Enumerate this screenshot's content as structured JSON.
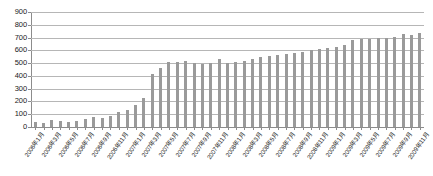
{
  "chart_data": {
    "type": "bar",
    "title": "",
    "subtitle": "",
    "xlabel": "",
    "ylabel": "",
    "ylim": [
      0,
      900
    ],
    "ytick_step": 100,
    "yticks": [
      900,
      800,
      700,
      600,
      500,
      400,
      300,
      200,
      100,
      0
    ],
    "grid": true,
    "legend": false,
    "legend_position": "none",
    "bar_color": "#9a9a9a",
    "gridline_color": "#b6b6b6",
    "axis_color": "#8c8c8c",
    "categories": [
      "2006年1月",
      "2006年2月",
      "2006年3月",
      "2006年4月",
      "2006年5月",
      "2006年6月",
      "2006年7月",
      "2006年8月",
      "2006年9月",
      "2006年10月",
      "2006年11月",
      "2006年12月",
      "2007年1月",
      "2007年2月",
      "2007年3月",
      "2007年4月",
      "2007年5月",
      "2007年6月",
      "2007年7月",
      "2007年8月",
      "2007年9月",
      "2007年10月",
      "2007年11月",
      "2007年12月",
      "2008年1月",
      "2008年2月",
      "2008年3月",
      "2008年4月",
      "2008年5月",
      "2008年6月",
      "2008年7月",
      "2008年8月",
      "2008年9月",
      "2008年10月",
      "2008年11月",
      "2008年12月",
      "2009年1月",
      "2009年2月",
      "2009年3月",
      "2009年4月",
      "2009年5月",
      "2009年6月",
      "2009年7月",
      "2009年8月",
      "2009年9月",
      "2009年10月",
      "2009年11月"
    ],
    "tick_label_every": 2,
    "values": [
      40,
      35,
      55,
      45,
      40,
      45,
      60,
      75,
      70,
      90,
      115,
      130,
      175,
      230,
      415,
      460,
      510,
      510,
      515,
      500,
      495,
      500,
      530,
      500,
      505,
      520,
      530,
      545,
      555,
      565,
      575,
      580,
      590,
      600,
      610,
      620,
      630,
      640,
      680,
      690,
      690,
      695,
      700,
      705,
      730,
      720,
      735
    ]
  }
}
